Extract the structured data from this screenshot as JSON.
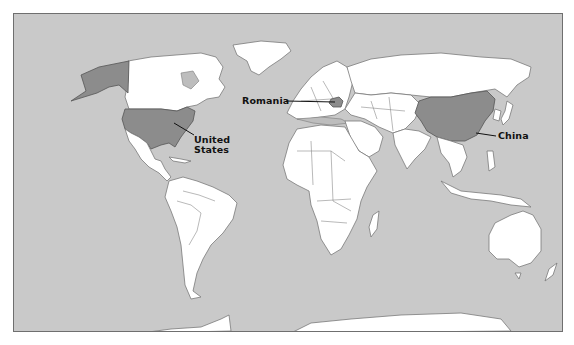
{
  "map": {
    "title": "",
    "colors": {
      "ocean": "#c9c9c9",
      "land": "#ffffff",
      "highlight": "#8c8c8c",
      "border": "#7a7a7a"
    },
    "labels": [
      {
        "id": "united-states",
        "text_line1": "United",
        "text_line2": "States"
      },
      {
        "id": "romania",
        "text": "Romania"
      },
      {
        "id": "china",
        "text": "China"
      }
    ],
    "highlighted_countries": [
      "United States",
      "Romania",
      "China"
    ]
  }
}
